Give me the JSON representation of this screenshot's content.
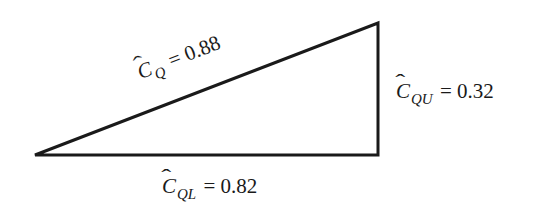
{
  "diagram": {
    "type": "right-triangle",
    "vertices": {
      "left": [
        35,
        155
      ],
      "top_right": [
        378,
        23
      ],
      "bottom_right": [
        378,
        155
      ]
    },
    "line_color": "#1a1a1a",
    "labels": {
      "hypotenuse": {
        "symbol": "C",
        "subscript": "Q",
        "equals": "=",
        "value": "0.88"
      },
      "vertical": {
        "symbol": "C",
        "subscript": "QU",
        "equals": "=",
        "value": "0.32"
      },
      "base": {
        "symbol": "C",
        "subscript": "QL",
        "equals": "=",
        "value": "0.82"
      }
    }
  }
}
